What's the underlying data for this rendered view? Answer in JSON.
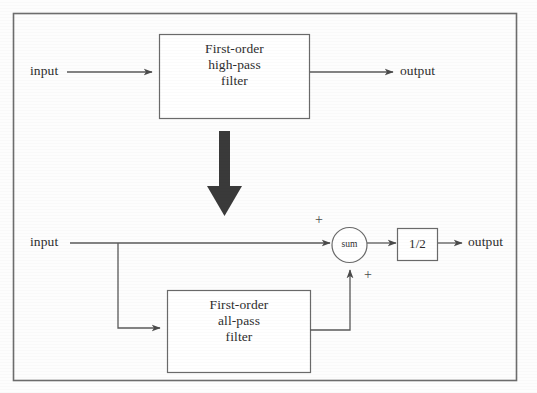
{
  "figure": {
    "type": "block-diagram",
    "title": "",
    "background_color": "#fdfdfd",
    "line_color": "#555555",
    "text_color": "#2e2e2e",
    "frame": {
      "x": 13,
      "y": 13,
      "width": 504,
      "height": 368
    }
  },
  "top_section": {
    "input_label": "input",
    "output_label": "output",
    "block": {
      "line1": "First-order",
      "line2": "high-pass",
      "line3": "filter"
    }
  },
  "transition_arrow": {
    "name": "equivalence-arrow",
    "direction": "down"
  },
  "bottom_section": {
    "input_label": "input",
    "output_label": "output",
    "block": {
      "line1": "First-order",
      "line2": "all-pass",
      "line3": "filter"
    },
    "summer": {
      "label": "sum",
      "sign_top": "+",
      "sign_bottom": "+"
    },
    "gain": {
      "label": "1/2"
    }
  }
}
